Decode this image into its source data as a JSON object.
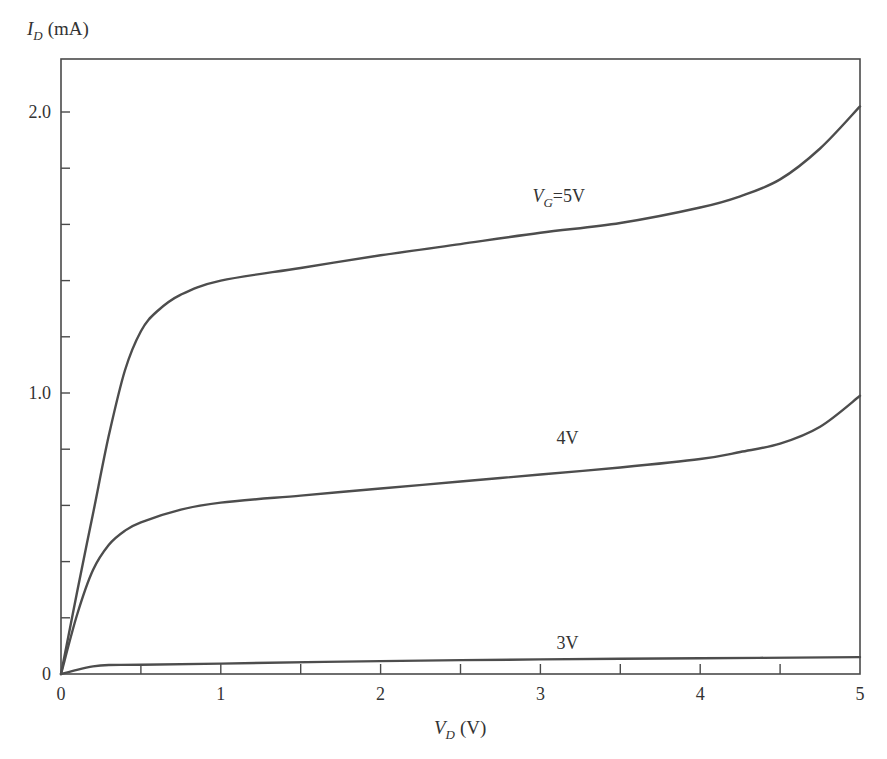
{
  "chart_data": {
    "type": "line",
    "title": "",
    "xlabel": "V_D (V)",
    "ylabel": "I_D (mA)",
    "xlabel_main": "V",
    "xlabel_sub": "D",
    "xlabel_unit": "(V)",
    "ylabel_main": "I",
    "ylabel_sub": "D",
    "ylabel_unit": "(mA)",
    "xlim": [
      0,
      5
    ],
    "ylim": [
      0,
      2.2
    ],
    "x_ticks": [
      0,
      1,
      2,
      3,
      4,
      5
    ],
    "x_tick_labels": [
      "0",
      "1",
      "2",
      "3",
      "4",
      "5"
    ],
    "x_minor_ticks": [
      0.5,
      1.5,
      2.5,
      3.5,
      4.5
    ],
    "y_ticks": [
      0,
      1.0,
      2.0
    ],
    "y_tick_labels": [
      "0",
      "1.0",
      "2.0"
    ],
    "y_minor_ticks": [
      0.2,
      0.4,
      0.6,
      0.8,
      1.2,
      1.4,
      1.6,
      1.8
    ],
    "grid": false,
    "legend": "inline labels on curves",
    "series": [
      {
        "name": "V_G=5V",
        "label_main": "V",
        "label_sub": "G",
        "label_rest": "=5V",
        "label_pos": [
          2.95,
          1.68
        ],
        "x": [
          0,
          0.1,
          0.2,
          0.3,
          0.4,
          0.5,
          0.6,
          0.75,
          1.0,
          1.5,
          2.0,
          2.5,
          3.0,
          3.5,
          4.0,
          4.25,
          4.5,
          4.75,
          5.0
        ],
        "y": [
          0,
          0.29,
          0.57,
          0.85,
          1.08,
          1.22,
          1.29,
          1.35,
          1.4,
          1.445,
          1.49,
          1.53,
          1.57,
          1.605,
          1.66,
          1.7,
          1.76,
          1.87,
          2.02
        ]
      },
      {
        "name": "4V",
        "label_main": "4V",
        "label_sub": "",
        "label_rest": "",
        "label_pos": [
          3.1,
          0.82
        ],
        "x": [
          0,
          0.1,
          0.2,
          0.3,
          0.4,
          0.5,
          0.75,
          1.0,
          1.5,
          2.0,
          2.5,
          3.0,
          3.5,
          4.0,
          4.25,
          4.5,
          4.75,
          5.0
        ],
        "y": [
          0,
          0.21,
          0.37,
          0.46,
          0.51,
          0.54,
          0.585,
          0.61,
          0.635,
          0.66,
          0.685,
          0.71,
          0.735,
          0.765,
          0.79,
          0.82,
          0.88,
          0.99
        ]
      },
      {
        "name": "3V",
        "label_main": "3V",
        "label_sub": "",
        "label_rest": "",
        "label_pos": [
          3.1,
          0.09
        ],
        "x": [
          0,
          0.1,
          0.2,
          0.3,
          0.5,
          1.0,
          2.0,
          3.0,
          4.0,
          5.0
        ],
        "y": [
          0,
          0.015,
          0.027,
          0.032,
          0.033,
          0.037,
          0.046,
          0.052,
          0.056,
          0.06
        ]
      }
    ],
    "colors": {
      "axis": "#4a4a4a",
      "curve": "#4d4d4d",
      "text": "#333333"
    }
  }
}
